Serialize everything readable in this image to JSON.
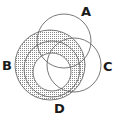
{
  "diagram": {
    "type": "venn",
    "sets": [
      {
        "id": "A",
        "label": "A",
        "cx": 64,
        "cy": 41,
        "r": 27,
        "shaded": false
      },
      {
        "id": "B",
        "label": "B",
        "cx": 50,
        "cy": 65,
        "r": 35,
        "shaded": true
      },
      {
        "id": "C",
        "label": "C",
        "cx": 74,
        "cy": 65,
        "r": 27,
        "shaded": false
      },
      {
        "id": "D",
        "label": "D",
        "cx": 52,
        "cy": 69,
        "r": 28,
        "shaded": true
      }
    ],
    "unshaded_inner_circle": {
      "cx": 52,
      "cy": 72,
      "r": 19
    },
    "shading_style": "stipple",
    "colors": {
      "stroke": "#6a6a6a",
      "stipple": "#8a8a8a",
      "label": "#1a1a1a",
      "background": "#ffffff"
    },
    "labels": {
      "A": "A",
      "B": "B",
      "C": "C",
      "D": "D"
    }
  }
}
